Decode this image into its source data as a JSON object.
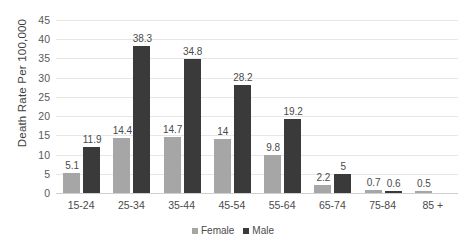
{
  "chart_data": {
    "type": "bar",
    "title": "",
    "xlabel": "",
    "ylabel": "Death Rate Per 100,000",
    "ylim": [
      0,
      45
    ],
    "ytick_step": 5,
    "yticks": [
      45,
      40,
      35,
      30,
      25,
      20,
      15,
      10,
      5,
      0
    ],
    "grid": true,
    "legend_position": "bottom-center",
    "categories": [
      "15-24",
      "25-34",
      "35-44",
      "45-54",
      "55-64",
      "65-74",
      "75-84",
      "85 +"
    ],
    "series": [
      {
        "name": "Female",
        "color": "#a6a6a6",
        "values": [
          5.1,
          14.4,
          14.7,
          14,
          9.8,
          2.2,
          0.7,
          0.5
        ],
        "labels": [
          "5.1",
          "14.4",
          "14.7",
          "14",
          "9.8",
          "2.2",
          "0.7",
          "0.5"
        ]
      },
      {
        "name": "Male",
        "color": "#3a3a3a",
        "values": [
          11.9,
          38.3,
          34.8,
          28.2,
          19.2,
          5,
          0.6,
          null
        ],
        "labels": [
          "11.9",
          "38.3",
          "34.8",
          "28.2",
          "19.2",
          "5",
          "0.6",
          ""
        ]
      }
    ]
  },
  "colors": {
    "female": "#a6a6a6",
    "male": "#3a3a3a",
    "gridline": "#e6e6e6",
    "text": "#4a4a4a",
    "background": "#ffffff"
  }
}
